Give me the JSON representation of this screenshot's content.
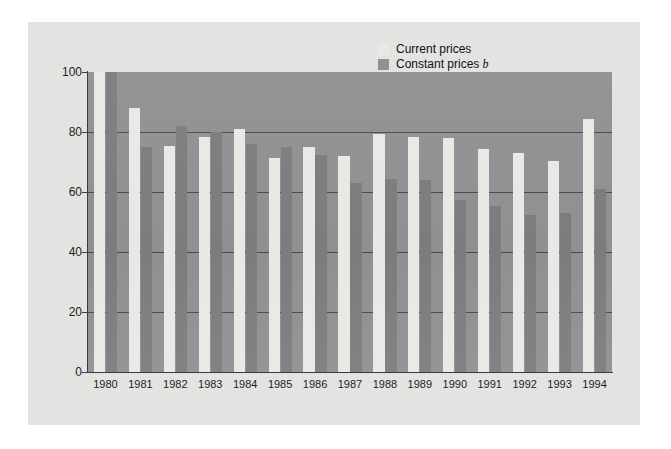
{
  "chart_data": {
    "type": "bar",
    "title": "",
    "xlabel": "",
    "ylabel": "",
    "ylim": [
      0,
      100
    ],
    "yticks": [
      0,
      20,
      40,
      60,
      80,
      100
    ],
    "grid": true,
    "legend_position": "top-right",
    "categories": [
      "1980",
      "1981",
      "1982",
      "1983",
      "1984",
      "1985",
      "1986",
      "1987",
      "1988",
      "1989",
      "1990",
      "1991",
      "1992",
      "1993",
      "1994"
    ],
    "series": [
      {
        "name": "Current prices",
        "color": "#e8e8e4",
        "values": [
          100,
          88,
          75.5,
          78.5,
          81,
          71.5,
          75,
          72,
          79.5,
          78.5,
          78,
          74.5,
          73,
          70.5,
          84.5
        ]
      },
      {
        "name": "Constant prices",
        "color": "#7b7c7e",
        "note": "b",
        "values": [
          100,
          75,
          82,
          80,
          76,
          75,
          72.5,
          63,
          64.5,
          64,
          57.5,
          55.5,
          52.5,
          53,
          61
        ]
      }
    ]
  },
  "legend": {
    "items": [
      {
        "label": "Current prices",
        "note": ""
      },
      {
        "label": "Constant prices",
        "note": "b"
      }
    ]
  },
  "colors": {
    "page_background": "#ffffff",
    "panel_background": "#e3e3e1",
    "plot_background": "#8f9092",
    "gridline": "#4a4a4c",
    "axis": "#3c3c3e",
    "current_prices": "#e8e8e4",
    "constant_prices": "#7b7c7e",
    "text": "#1d1d1f"
  }
}
